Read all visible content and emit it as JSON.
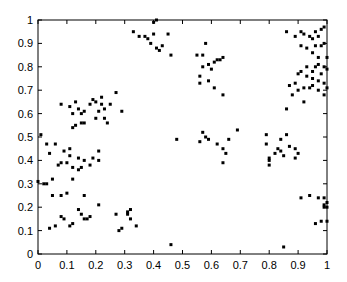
{
  "chart_data": {
    "type": "scatter",
    "title": "",
    "xlabel": "",
    "ylabel": "",
    "xlim": [
      0,
      1
    ],
    "ylim": [
      0,
      1
    ],
    "grid": false,
    "legend": null,
    "x_ticks": [
      "0",
      "0.1",
      "0.2",
      "0.3",
      "0.4",
      "0.5",
      "0.6",
      "0.7",
      "0.8",
      "0.9",
      "1"
    ],
    "y_ticks": [
      "0",
      "0.1",
      "0.2",
      "0.3",
      "0.4",
      "0.5",
      "0.6",
      "0.7",
      "0.8",
      "0.9",
      "1"
    ],
    "marker_color": "#000000",
    "series": [
      {
        "name": "points",
        "points": [
          [
            0.08,
            0.64
          ],
          [
            0.11,
            0.63
          ],
          [
            0.13,
            0.65
          ],
          [
            0.12,
            0.6
          ],
          [
            0.14,
            0.62
          ],
          [
            0.15,
            0.6
          ],
          [
            0.16,
            0.61
          ],
          [
            0.18,
            0.64
          ],
          [
            0.19,
            0.66
          ],
          [
            0.2,
            0.65
          ],
          [
            0.21,
            0.61
          ],
          [
            0.22,
            0.64
          ],
          [
            0.22,
            0.67
          ],
          [
            0.23,
            0.62
          ],
          [
            0.25,
            0.64
          ],
          [
            0.23,
            0.58
          ],
          [
            0.2,
            0.58
          ],
          [
            0.16,
            0.56
          ],
          [
            0.15,
            0.56
          ],
          [
            0.13,
            0.55
          ],
          [
            0.12,
            0.54
          ],
          [
            0.24,
            0.56
          ],
          [
            0.29,
            0.61
          ],
          [
            0.27,
            0.69
          ],
          [
            0.01,
            0.51
          ],
          [
            0.03,
            0.47
          ],
          [
            0.04,
            0.43
          ],
          [
            0.0,
            0.31
          ],
          [
            0.02,
            0.3
          ],
          [
            0.03,
            0.3
          ],
          [
            0.05,
            0.32
          ],
          [
            0.07,
            0.38
          ],
          [
            0.08,
            0.39
          ],
          [
            0.1,
            0.39
          ],
          [
            0.11,
            0.42
          ],
          [
            0.12,
            0.37
          ],
          [
            0.14,
            0.36
          ],
          [
            0.15,
            0.37
          ],
          [
            0.12,
            0.32
          ],
          [
            0.14,
            0.41
          ],
          [
            0.16,
            0.4
          ],
          [
            0.18,
            0.38
          ],
          [
            0.19,
            0.41
          ],
          [
            0.21,
            0.4
          ],
          [
            0.21,
            0.44
          ],
          [
            0.06,
            0.47
          ],
          [
            0.09,
            0.44
          ],
          [
            0.11,
            0.45
          ],
          [
            0.05,
            0.25
          ],
          [
            0.08,
            0.25
          ],
          [
            0.1,
            0.26
          ],
          [
            0.16,
            0.25
          ],
          [
            0.21,
            0.21
          ],
          [
            0.04,
            0.11
          ],
          [
            0.06,
            0.12
          ],
          [
            0.08,
            0.16
          ],
          [
            0.09,
            0.15
          ],
          [
            0.11,
            0.12
          ],
          [
            0.12,
            0.13
          ],
          [
            0.14,
            0.19
          ],
          [
            0.15,
            0.17
          ],
          [
            0.16,
            0.15
          ],
          [
            0.17,
            0.15
          ],
          [
            0.18,
            0.16
          ],
          [
            0.27,
            0.17
          ],
          [
            0.28,
            0.1
          ],
          [
            0.29,
            0.11
          ],
          [
            0.31,
            0.18
          ],
          [
            0.32,
            0.19
          ],
          [
            0.32,
            0.15
          ],
          [
            0.34,
            0.12
          ],
          [
            0.31,
            0.17
          ],
          [
            0.46,
            0.04
          ],
          [
            0.33,
            0.95
          ],
          [
            0.35,
            0.93
          ],
          [
            0.37,
            0.93
          ],
          [
            0.38,
            0.92
          ],
          [
            0.39,
            0.9
          ],
          [
            0.4,
            0.94
          ],
          [
            0.41,
            0.88
          ],
          [
            0.42,
            0.87
          ],
          [
            0.43,
            0.89
          ],
          [
            0.45,
            0.94
          ],
          [
            0.4,
            0.99
          ],
          [
            0.41,
            1.0
          ],
          [
            0.46,
            0.85
          ],
          [
            0.55,
            0.85
          ],
          [
            0.57,
            0.85
          ],
          [
            0.58,
            0.9
          ],
          [
            0.59,
            0.81
          ],
          [
            0.6,
            0.79
          ],
          [
            0.61,
            0.82
          ],
          [
            0.62,
            0.83
          ],
          [
            0.63,
            0.83
          ],
          [
            0.64,
            0.84
          ],
          [
            0.57,
            0.8
          ],
          [
            0.56,
            0.76
          ],
          [
            0.59,
            0.74
          ],
          [
            0.61,
            0.71
          ],
          [
            0.64,
            0.68
          ],
          [
            0.56,
            0.73
          ],
          [
            0.57,
            0.52
          ],
          [
            0.58,
            0.5
          ],
          [
            0.59,
            0.49
          ],
          [
            0.56,
            0.48
          ],
          [
            0.62,
            0.47
          ],
          [
            0.64,
            0.45
          ],
          [
            0.65,
            0.43
          ],
          [
            0.66,
            0.49
          ],
          [
            0.69,
            0.53
          ],
          [
            0.48,
            0.49
          ],
          [
            0.64,
            0.39
          ],
          [
            0.79,
            0.51
          ],
          [
            0.79,
            0.47
          ],
          [
            0.8,
            0.41
          ],
          [
            0.8,
            0.38
          ],
          [
            0.8,
            0.4
          ],
          [
            0.82,
            0.43
          ],
          [
            0.83,
            0.45
          ],
          [
            0.84,
            0.44
          ],
          [
            0.84,
            0.49
          ],
          [
            0.85,
            0.42
          ],
          [
            0.86,
            0.51
          ],
          [
            0.87,
            0.46
          ],
          [
            0.89,
            0.45
          ],
          [
            0.89,
            0.41
          ],
          [
            0.9,
            0.43
          ],
          [
            0.86,
            0.95
          ],
          [
            0.89,
            0.93
          ],
          [
            0.91,
            0.95
          ],
          [
            0.92,
            0.94
          ],
          [
            0.94,
            0.93
          ],
          [
            0.95,
            0.92
          ],
          [
            0.96,
            0.95
          ],
          [
            0.97,
            0.93
          ],
          [
            0.98,
            0.96
          ],
          [
            0.99,
            0.97
          ],
          [
            0.91,
            0.89
          ],
          [
            0.93,
            0.88
          ],
          [
            0.96,
            0.89
          ],
          [
            0.98,
            0.89
          ],
          [
            0.99,
            0.9
          ],
          [
            0.95,
            0.86
          ],
          [
            0.97,
            0.84
          ],
          [
            1.0,
            0.84
          ],
          [
            0.93,
            0.8
          ],
          [
            0.95,
            0.78
          ],
          [
            0.96,
            0.8
          ],
          [
            0.97,
            0.81
          ],
          [
            0.99,
            0.8
          ],
          [
            1.0,
            0.79
          ],
          [
            0.9,
            0.77
          ],
          [
            0.91,
            0.78
          ],
          [
            0.93,
            0.76
          ],
          [
            0.95,
            0.75
          ],
          [
            0.97,
            0.74
          ],
          [
            0.98,
            0.77
          ],
          [
            0.99,
            0.73
          ],
          [
            0.89,
            0.73
          ],
          [
            0.9,
            0.7
          ],
          [
            0.92,
            0.71
          ],
          [
            0.94,
            0.71
          ],
          [
            0.95,
            0.72
          ],
          [
            0.97,
            0.7
          ],
          [
            0.99,
            0.68
          ],
          [
            0.92,
            0.65
          ],
          [
            0.88,
            0.68
          ],
          [
            0.86,
            0.62
          ],
          [
            0.87,
            0.72
          ],
          [
            1.0,
            0.71
          ],
          [
            0.91,
            0.24
          ],
          [
            0.94,
            0.25
          ],
          [
            0.97,
            0.24
          ],
          [
            0.99,
            0.24
          ],
          [
            0.99,
            0.21
          ],
          [
            1.0,
            0.22
          ],
          [
            0.96,
            0.13
          ],
          [
            0.98,
            0.14
          ],
          [
            1.0,
            0.14
          ],
          [
            0.85,
            0.03
          ],
          [
            1.0,
            0.2
          ],
          [
            0.99,
            0.2
          ]
        ]
      }
    ]
  }
}
